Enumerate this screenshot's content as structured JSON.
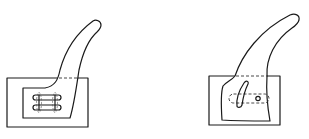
{
  "figures": [
    {
      "id": "left",
      "description": "Curved arm on rectangular base with two horizontal slots",
      "base_rect": {
        "x": 7,
        "y": 78,
        "w": 81,
        "h": 49
      },
      "inner_recess": {
        "x": 23,
        "y": 88,
        "w": 50,
        "h": 30
      },
      "slots": 2
    },
    {
      "id": "right",
      "description": "Curved arm on rectangular base with curved slot and small hole",
      "base_rect": {
        "x": 209,
        "y": 76,
        "w": 71,
        "h": 49
      },
      "features": [
        "curved-slot",
        "small-hole",
        "hidden-slot-dashed"
      ]
    }
  ],
  "colors": {
    "line": "#1a1a1a",
    "background": "#ffffff"
  }
}
